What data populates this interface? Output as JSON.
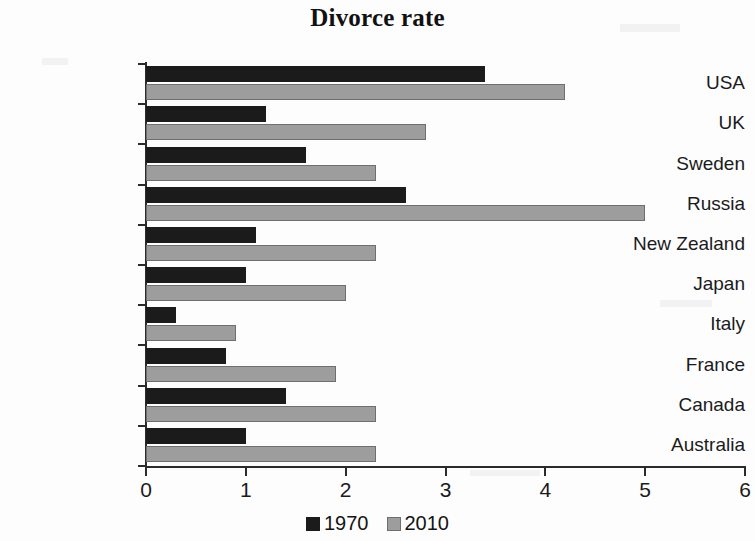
{
  "chart_data": {
    "type": "bar",
    "orientation": "horizontal",
    "title": "Divorce rate",
    "xlabel": "",
    "ylabel": "",
    "xlim": [
      0,
      6
    ],
    "xticks": [
      0,
      1,
      2,
      3,
      4,
      5,
      6
    ],
    "grid": false,
    "legend_position": "bottom",
    "categories": [
      "USA",
      "UK",
      "Sweden",
      "Russia",
      "New Zealand",
      "Japan",
      "Italy",
      "France",
      "Canada",
      "Australia"
    ],
    "series": [
      {
        "name": "1970",
        "color": "#1b1b1b",
        "values": [
          3.4,
          1.2,
          1.6,
          2.6,
          1.1,
          1.0,
          0.3,
          0.8,
          1.4,
          1.0
        ]
      },
      {
        "name": "2010",
        "color": "#9d9d9d",
        "values": [
          4.2,
          2.8,
          2.3,
          5.0,
          2.3,
          2.0,
          0.9,
          1.9,
          2.3,
          2.3
        ]
      }
    ]
  }
}
